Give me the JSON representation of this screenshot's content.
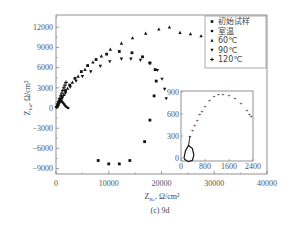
{
  "chart_data": [
    {
      "type": "scatter",
      "title": "",
      "caption": "(c) 9d",
      "xlabel": "Z_Re, Ω/cm²",
      "ylabel": "Z_Im, Ω/cm²",
      "xlim": [
        0,
        40000
      ],
      "ylim": [
        -10000,
        13500
      ],
      "x_ticks": [
        0,
        10000,
        20000,
        30000,
        40000
      ],
      "y_ticks": [
        -9000,
        -6000,
        -3000,
        0,
        3000,
        6000,
        9000,
        12000
      ],
      "grid": false,
      "legend_position": "upper right",
      "series": [
        {
          "name": "初始试样",
          "marker": "square",
          "points": [
            [
              300,
              300
            ],
            [
              700,
              900
            ],
            [
              1200,
              1700
            ],
            [
              1800,
              2600
            ],
            [
              2600,
              3400
            ],
            [
              3600,
              4400
            ],
            [
              4800,
              5400
            ],
            [
              6000,
              6300
            ],
            [
              7600,
              7200
            ],
            [
              9600,
              8000
            ],
            [
              12000,
              8400
            ],
            [
              14400,
              8200
            ],
            [
              16400,
              7600
            ],
            [
              17800,
              6700
            ],
            [
              18800,
              5700
            ],
            [
              19000,
              4000
            ],
            [
              18600,
              1800
            ],
            [
              17800,
              -1800
            ],
            [
              16800,
              -5000
            ],
            [
              14000,
              -7800
            ],
            [
              12000,
              -8300
            ],
            [
              10000,
              -8300
            ],
            [
              8000,
              -7800
            ]
          ]
        },
        {
          "name": "室温",
          "marker": "circle",
          "points": [
            [
              100,
              100
            ],
            [
              200,
              300
            ],
            [
              350,
              600
            ],
            [
              500,
              900
            ],
            [
              650,
              1100
            ],
            [
              800,
              1200
            ],
            [
              1000,
              1100
            ],
            [
              1200,
              900
            ],
            [
              1400,
              700
            ],
            [
              1600,
              500
            ],
            [
              1800,
              300
            ],
            [
              2000,
              150
            ],
            [
              2300,
              0
            ]
          ]
        },
        {
          "name": "60℃",
          "marker": "triangle-up",
          "points": [
            [
              400,
              500
            ],
            [
              900,
              1200
            ],
            [
              1500,
              2000
            ],
            [
              2200,
              2900
            ],
            [
              3100,
              3800
            ],
            [
              4200,
              4700
            ],
            [
              5500,
              5700
            ],
            [
              7000,
              6800
            ],
            [
              8600,
              7700
            ],
            [
              10300,
              8700
            ],
            [
              12400,
              9600
            ],
            [
              14500,
              10400
            ],
            [
              17000,
              11100
            ],
            [
              19500,
              11700
            ],
            [
              21500,
              12000
            ],
            [
              23500,
              11200
            ],
            [
              25500,
              11000
            ],
            [
              27500,
              10700
            ]
          ]
        },
        {
          "name": "90℃",
          "marker": "triangle-down",
          "points": [
            [
              500,
              500
            ],
            [
              1100,
              1300
            ],
            [
              1800,
              2200
            ],
            [
              2700,
              3100
            ],
            [
              3800,
              4000
            ],
            [
              5000,
              4700
            ],
            [
              6600,
              5400
            ],
            [
              8400,
              6200
            ],
            [
              10200,
              6900
            ],
            [
              12400,
              7300
            ],
            [
              14200,
              7300
            ],
            [
              16000,
              7100
            ],
            [
              17800,
              6600
            ],
            [
              19200,
              5600
            ],
            [
              20100,
              4300
            ],
            [
              20600,
              2800
            ],
            [
              20900,
              1400
            ]
          ]
        },
        {
          "name": "120℃",
          "marker": "plus",
          "points": [
            [
              100,
              200
            ],
            [
              300,
              600
            ],
            [
              500,
              1000
            ],
            [
              700,
              1400
            ],
            [
              900,
              1800
            ],
            [
              1100,
              2200
            ],
            [
              1300,
              2600
            ],
            [
              1500,
              3000
            ],
            [
              1700,
              3400
            ],
            [
              1900,
              3800
            ]
          ]
        }
      ]
    },
    {
      "type": "scatter",
      "title": "inset",
      "xlim": [
        0,
        2400
      ],
      "ylim": [
        -50,
        950
      ],
      "x_ticks": [
        0,
        800,
        1600,
        2400
      ],
      "y_ticks": [
        0,
        300,
        600,
        900
      ],
      "grid": false,
      "series": [
        {
          "name": "室温 (inset)",
          "marker": "dot",
          "points": [
            [
              300,
              300
            ],
            [
              380,
              370
            ],
            [
              460,
              440
            ],
            [
              540,
              510
            ],
            [
              620,
              590
            ],
            [
              700,
              640
            ],
            [
              800,
              700
            ],
            [
              950,
              780
            ],
            [
              1100,
              840
            ],
            [
              1250,
              860
            ],
            [
              1400,
              870
            ],
            [
              1600,
              850
            ],
            [
              1800,
              810
            ],
            [
              2000,
              740
            ],
            [
              2200,
              650
            ],
            [
              2280,
              600
            ],
            [
              2340,
              570
            ]
          ]
        },
        {
          "name": "loop",
          "marker": "line",
          "points": [
            [
              100,
              0
            ],
            [
              150,
              100
            ],
            [
              250,
              170
            ],
            [
              380,
              130
            ],
            [
              430,
              40
            ],
            [
              380,
              -30
            ],
            [
              250,
              -50
            ],
            [
              130,
              -20
            ],
            [
              100,
              0
            ]
          ]
        }
      ]
    }
  ],
  "labels": {
    "y_axis": "Z",
    "y_axis_sub": "Im",
    "y_axis_unit": ",  Ω/cm²",
    "x_axis": "Z",
    "x_axis_sub": "Re",
    "x_axis_unit": ",  Ω/cm²",
    "caption": "(c)  9d"
  },
  "legend": [
    {
      "label": "初始试样",
      "marker": "square"
    },
    {
      "label": "室温",
      "marker": "circle"
    },
    {
      "label": "60℃",
      "marker": "triangle-up"
    },
    {
      "label": "90℃",
      "marker": "triangle-down"
    },
    {
      "label": "120℃",
      "marker": "plus"
    }
  ],
  "main_ticks": {
    "x": [
      "0",
      "10000",
      "20000",
      "30000",
      "40000"
    ],
    "y": [
      "12000",
      "9000",
      "6000",
      "3000",
      "0",
      "-3000",
      "-6000",
      "-9000"
    ]
  },
  "inset_ticks": {
    "x": [
      "0",
      "800",
      "1600",
      "2400"
    ],
    "y": [
      "900",
      "600",
      "300",
      "0"
    ]
  },
  "colors": {
    "marker": "#111111",
    "axis": "#666666"
  }
}
